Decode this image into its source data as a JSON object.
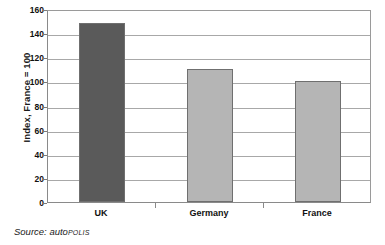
{
  "chart_data": {
    "type": "bar",
    "title": "",
    "categories": [
      "UK",
      "Germany",
      "France"
    ],
    "values": [
      148,
      110,
      100
    ],
    "series": [
      {
        "name": "Index, France = 100",
        "values": [
          148,
          110,
          100
        ]
      }
    ],
    "xlabel": "",
    "ylabel": "Index, France = 100",
    "ylim": [
      0,
      160
    ],
    "yticks": [
      0,
      20,
      40,
      60,
      80,
      100,
      120,
      140,
      160
    ],
    "ytick_labels": [
      "0",
      "20",
      "40",
      "60",
      "80",
      "100",
      "120",
      "140",
      "160"
    ],
    "grid": "horizontal",
    "legend": "none",
    "bar_colors": [
      "#5a5a5a",
      "#b5b5b5",
      "#b5b5b5"
    ],
    "annotations": []
  },
  "axis": {
    "y_title": "Index, France = 100"
  },
  "source": {
    "prefix": "Source: ",
    "brand_main": "auto",
    "brand_suffix": "POLIS"
  },
  "colors": {
    "bar_dark": "#5a5a5a",
    "bar_light": "#b5b5b5",
    "gridline": "#a8a8a8",
    "axis": "#8a8a8a",
    "background": "#ffffff",
    "text": "#1a1a1a"
  }
}
